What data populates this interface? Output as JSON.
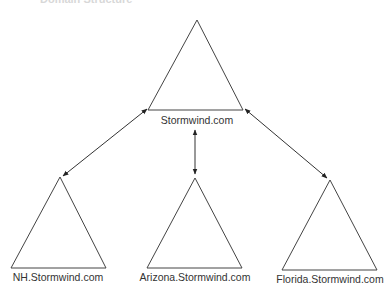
{
  "title": "Domain Structure",
  "diagram": {
    "root": {
      "label": "Stormwind.com"
    },
    "children": [
      {
        "label": "NH.Stormwind.com"
      },
      {
        "label": "Arizona.Stormwind.com"
      },
      {
        "label": "Florida.Stormwind.com"
      }
    ],
    "connections": [
      {
        "from": "Stormwind.com",
        "to": "NH.Stormwind.com",
        "bidirectional": true
      },
      {
        "from": "Stormwind.com",
        "to": "Arizona.Stormwind.com",
        "bidirectional": true
      },
      {
        "from": "Stormwind.com",
        "to": "Florida.Stormwind.com",
        "bidirectional": true
      }
    ],
    "colors": {
      "stroke": "#333333",
      "background": "#ffffff"
    }
  }
}
